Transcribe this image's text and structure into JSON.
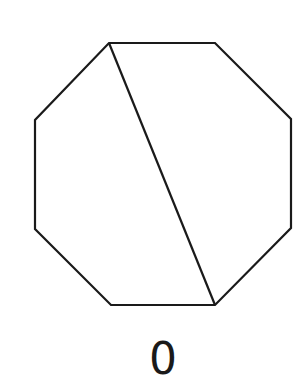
{
  "diagram": {
    "shape": "octagon",
    "stroke_color": "#1a1a1a",
    "vertices": [
      [
        109,
        43
      ],
      [
        215,
        43
      ],
      [
        291,
        119
      ],
      [
        291,
        228
      ],
      [
        215,
        305
      ],
      [
        111,
        305
      ],
      [
        35,
        229
      ],
      [
        35,
        120
      ]
    ],
    "diagonal": {
      "from": [
        109,
        43
      ],
      "to": [
        215,
        305
      ]
    },
    "label": "0"
  }
}
